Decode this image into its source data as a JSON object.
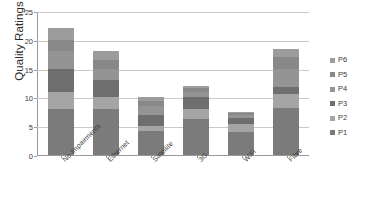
{
  "chart_data": {
    "type": "bar",
    "stacked": true,
    "title": "",
    "xlabel": "",
    "ylabel": "Quality Ratings",
    "ylim": [
      0,
      25
    ],
    "yticks": [
      0,
      5,
      10,
      15,
      20,
      25
    ],
    "grid": true,
    "legend_position": "right",
    "categories": [
      "No Impairments",
      "Ethernet",
      "Satellite",
      "3G",
      "WiFi",
      "Fibre"
    ],
    "series": [
      {
        "name": "P1",
        "color": "#7b7b7b",
        "values": [
          8.0,
          8.0,
          4.2,
          6.2,
          4.0,
          8.2
        ]
      },
      {
        "name": "P2",
        "color": "#a5a5a5",
        "values": [
          3.0,
          2.0,
          0.8,
          1.8,
          1.4,
          2.4
        ]
      },
      {
        "name": "P3",
        "color": "#6e6e6e",
        "values": [
          4.0,
          3.0,
          2.0,
          2.0,
          1.0,
          1.2
        ]
      },
      {
        "name": "P4",
        "color": "#949494",
        "values": [
          3.0,
          2.0,
          1.5,
          1.0,
          0.6,
          3.2
        ]
      },
      {
        "name": "P5",
        "color": "#888888",
        "values": [
          2.0,
          1.5,
          0.8,
          0.6,
          0.3,
          2.0
        ]
      },
      {
        "name": "P6",
        "color": "#9c9c9c",
        "values": [
          2.0,
          1.5,
          0.7,
          0.4,
          0.2,
          1.5
        ]
      }
    ],
    "totals": [
      22.0,
      18.0,
      10.0,
      12.0,
      7.5,
      18.5
    ],
    "legend_order": [
      "P6",
      "P5",
      "P4",
      "P3",
      "P2",
      "P1"
    ]
  },
  "colors": {
    "grid": "#c9c9c9",
    "axis": "#9a9a9a",
    "text": "#3a3a3a",
    "background": "#ffffff"
  }
}
